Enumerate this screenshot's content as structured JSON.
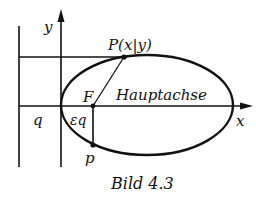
{
  "figure": {
    "caption": "Bild 4.3",
    "labels": {
      "y_axis": "y",
      "x_axis": "x",
      "point_P": "P(x|y)",
      "focus": "F",
      "main_axis": "Hauptachse",
      "directrix_distance": "q",
      "focus_distance": "εq",
      "semi_latus_rectum": "p"
    }
  },
  "colors": {
    "stroke": "#111111",
    "background": "#ffffff"
  }
}
